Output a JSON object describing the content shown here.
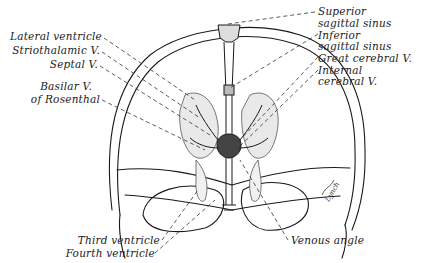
{
  "diagram": {
    "type": "anatomical-illustration",
    "signature": "Lynch",
    "colors": {
      "line": "#1a1a1a",
      "shading": "#9a9a9a",
      "background": "#ffffff"
    }
  },
  "labels": {
    "left": {
      "lateral_ventricle": "Lateral ventricle",
      "striothalamic_v": "Striothalamic V.",
      "septal_v": "Septal V.",
      "basilar_v_line1": "Basilar V.",
      "basilar_v_line2": "of Rosenthal"
    },
    "right": {
      "superior_sagittal_line1": "Superior",
      "superior_sagittal_line2": "sagittal sinus",
      "inferior_sagittal_line1": "Inferior",
      "inferior_sagittal_line2": "sagittal sinus",
      "great_cerebral_v": "Great cerebral V.",
      "internal_cerebral_line1": "Internal",
      "internal_cerebral_line2": "cerebral V."
    },
    "bottom": {
      "third_ventricle": "Third ventricle",
      "fourth_ventricle": "Fourth ventricle",
      "venous_angle": "Venous angle"
    }
  }
}
